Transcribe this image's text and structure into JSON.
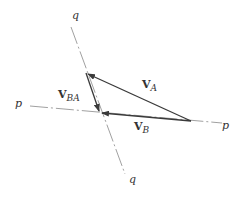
{
  "diagram": {
    "axes": {
      "p": {
        "label_left": "p",
        "label_right": "p"
      },
      "q": {
        "label_top": "q",
        "label_bottom": "q"
      }
    },
    "vectors": {
      "VA": {
        "main": "V",
        "sub": "A"
      },
      "VB": {
        "main": "V",
        "sub": "B"
      },
      "VBA": {
        "main": "V",
        "sub": "BA"
      }
    },
    "colors": {
      "vector": "#3a3a3a",
      "axis": "#888888",
      "text": "#333333",
      "background": "#ffffff"
    }
  }
}
